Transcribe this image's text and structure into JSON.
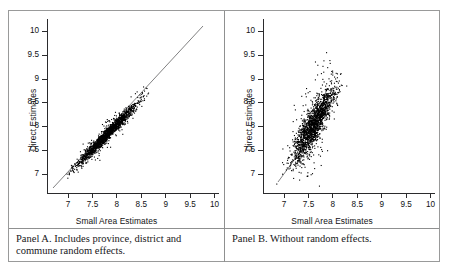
{
  "figure": {
    "panels": [
      {
        "id": "panel-a",
        "ylabel": "Direct Estimates",
        "xlabel": "Small Area Estimates",
        "caption": "Panel A. Includes province, district and commune random effects."
      },
      {
        "id": "panel-b",
        "ylabel": "Direct Estimates",
        "xlabel": "Small Area Estimates",
        "caption": "Panel B. Without random effects."
      }
    ]
  },
  "chart_data": [
    {
      "type": "scatter",
      "title": "Panel A. Includes province, district and commune random effects.",
      "xlabel": "Small Area Estimates",
      "ylabel": "Direct Estimates",
      "xlim": [
        6.6,
        10.1
      ],
      "ylim": [
        6.6,
        10.25
      ],
      "xticks": [
        7,
        7.5,
        8,
        8.5,
        9,
        9.5,
        10
      ],
      "yticks": [
        7,
        7.5,
        8,
        8.5,
        9,
        9.5,
        10
      ],
      "xticklabels": [
        "7",
        "7.5",
        "8",
        "8.5",
        "9",
        "9.5",
        "10"
      ],
      "yticklabels": [
        "7",
        "7.5",
        "8",
        "8.5",
        "9",
        "9.5",
        "10"
      ],
      "grid": false,
      "legend": false,
      "marker_color": "#000000",
      "marker_size": 1.1,
      "n_points": 1800,
      "reference_line": {
        "type": "identity",
        "from": [
          6.7,
          6.7
        ],
        "to": [
          9.75,
          9.95
        ],
        "color": "#4a4a4c"
      },
      "cloud": {
        "description": "dense narrow elongated cloud hugging the 45-degree identity line",
        "x_range": [
          6.65,
          9.75
        ],
        "x_mode": 7.8,
        "slope": 1.05,
        "intercept": -0.35,
        "residual_sd": 0.085,
        "x_sd": 0.42,
        "correlation": 0.96
      }
    },
    {
      "type": "scatter",
      "title": "Panel B. Without random effects.",
      "xlabel": "Small Area Estimates",
      "ylabel": "Direct Estimates",
      "xlim": [
        6.6,
        10.1
      ],
      "ylim": [
        6.6,
        10.25
      ],
      "xticks": [
        7,
        7.5,
        8,
        8.5,
        9,
        9.5,
        10
      ],
      "yticks": [
        7,
        7.5,
        8,
        8.5,
        9,
        9.5,
        10
      ],
      "xticklabels": [
        "7",
        "7.5",
        "8",
        "8.5",
        "9",
        "9.5",
        "10"
      ],
      "yticklabels": [
        "7",
        "7.5",
        "8",
        "8.5",
        "9",
        "9.5",
        "10"
      ],
      "grid": false,
      "legend": false,
      "marker_color": "#000000",
      "marker_size": 1.1,
      "n_points": 1800,
      "reference_line": {
        "type": "identity",
        "from": [
          6.95,
          6.85
        ],
        "to": [
          7.35,
          7.45
        ],
        "color": "#5a5a5c"
      },
      "cloud": {
        "description": "steeper, much more dispersed cloud concentrated between 7 and 8.5 on x, fanning upward to 10.2 on y",
        "x_range": [
          6.7,
          8.9
        ],
        "x_mode": 7.6,
        "slope": 1.55,
        "intercept": -3.75,
        "residual_sd": 0.26,
        "x_sd": 0.3,
        "correlation": 0.78
      }
    }
  ]
}
